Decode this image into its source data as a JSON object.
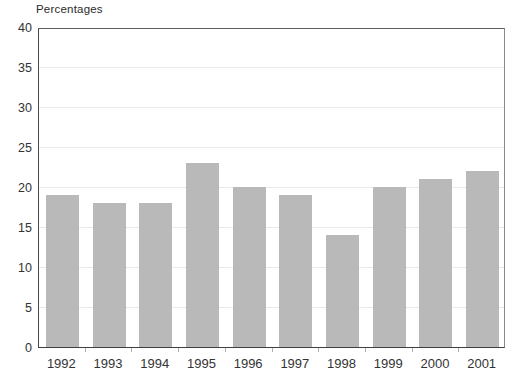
{
  "chart": {
    "title": "Percentages"
  },
  "chart_data": {
    "type": "bar",
    "title": "Percentages",
    "categories": [
      "1992",
      "1993",
      "1994",
      "1995",
      "1996",
      "1997",
      "1998",
      "1999",
      "2000",
      "2001"
    ],
    "values": [
      19,
      18,
      18,
      23,
      20,
      19,
      14,
      20,
      21,
      22
    ],
    "xlabel": "",
    "ylabel": "Percentages",
    "ylim": [
      0,
      40
    ],
    "ytick_step": 5,
    "ytick_labels": [
      "0",
      "5",
      "10",
      "15",
      "20",
      "25",
      "30",
      "35",
      "40"
    ],
    "grid": true,
    "legend_position": "none",
    "colors": {
      "bar": "#b9b9b9",
      "grid": "#e9e9e9",
      "frame": "#5c5c5c",
      "axis": "#3f3f3f",
      "tick": "#b0b0b0",
      "text": "#333333",
      "background": "#ffffff"
    }
  }
}
